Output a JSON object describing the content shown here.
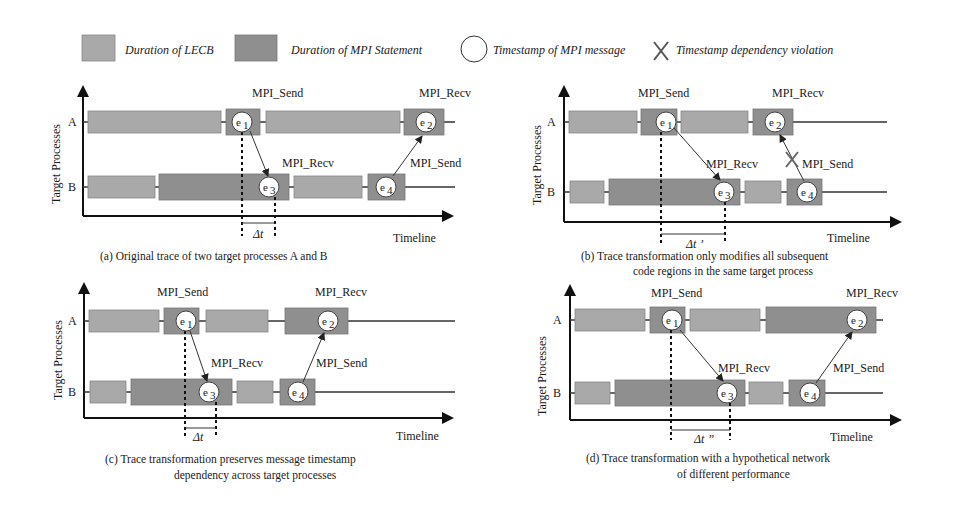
{
  "colors": {
    "lecb": "#a9a9a9",
    "mpi": "#8f8f8f",
    "line": "#333333",
    "bg": "#ffffff"
  },
  "legend": [
    {
      "kind": "lecb-swatch",
      "label": "Duration of LECB"
    },
    {
      "kind": "mpi-swatch",
      "label": "Duration of MPI Statement"
    },
    {
      "kind": "circle",
      "label": "Timestamp of MPI message"
    },
    {
      "kind": "cross",
      "label": "Timestamp dependency violation"
    }
  ],
  "axis": {
    "y_label": "Target Processes",
    "x_label": "Timeline",
    "process_a": "A",
    "process_b": "B"
  },
  "labels": {
    "send": "MPI_Send",
    "recv": "MPI_Recv"
  },
  "events": {
    "e1": "e",
    "e1_sub": "1",
    "e2": "e",
    "e2_sub": "2",
    "e3": "e",
    "e3_sub": "3",
    "e4": "e",
    "e4_sub": "4"
  },
  "panels": [
    {
      "id": "a",
      "delta": "Δt",
      "caption": [
        "(a)  Original trace of two target processes A and B"
      ]
    },
    {
      "id": "b",
      "delta": "Δt ’",
      "caption": [
        "(b) Trace transformation only modifies all subsequent",
        "code regions in the same target process"
      ]
    },
    {
      "id": "c",
      "delta": "Δt",
      "caption": [
        "(c)  Trace transformation preserves message timestamp",
        "dependency across target processes"
      ]
    },
    {
      "id": "d",
      "delta": "Δt ”",
      "caption": [
        "(d)  Trace transformation with a hypothetical network",
        "of different performance"
      ]
    }
  ]
}
